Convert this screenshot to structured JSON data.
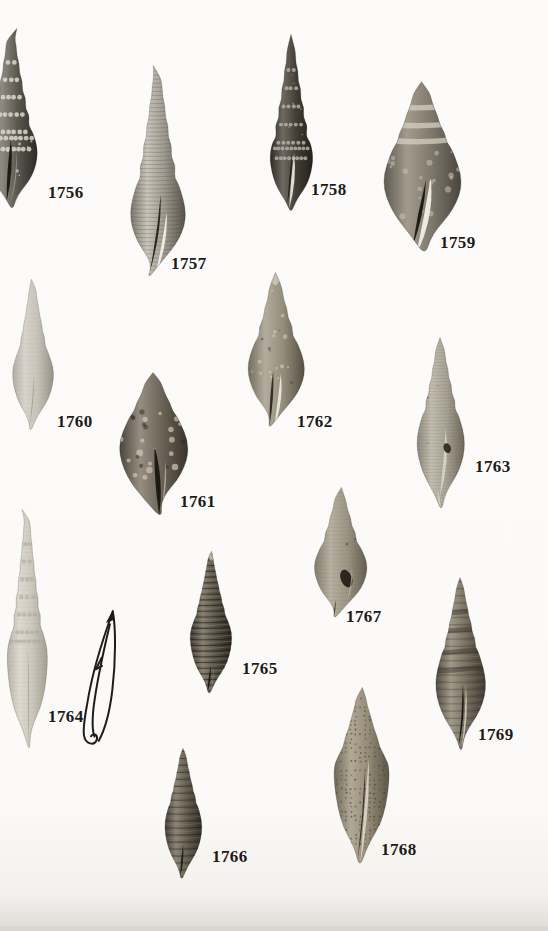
{
  "plate": {
    "kind": "photographic-plate-of-gastropod-shell-specimens",
    "figures": [
      {
        "id": "1756",
        "label": "1756",
        "kind": "specimen-photograph"
      },
      {
        "id": "1757",
        "label": "1757",
        "kind": "specimen-photograph"
      },
      {
        "id": "1758",
        "label": "1758",
        "kind": "specimen-photograph"
      },
      {
        "id": "1759",
        "label": "1759",
        "kind": "specimen-photograph"
      },
      {
        "id": "1760",
        "label": "1760",
        "kind": "specimen-photograph"
      },
      {
        "id": "1761",
        "label": "1761",
        "kind": "specimen-photograph"
      },
      {
        "id": "1762",
        "label": "1762",
        "kind": "specimen-photograph"
      },
      {
        "id": "1763",
        "label": "1763",
        "kind": "specimen-photograph"
      },
      {
        "id": "1764",
        "label": "1764",
        "kind": "specimen-photograph"
      },
      {
        "id": "1765",
        "label": "1765",
        "kind": "specimen-photograph"
      },
      {
        "id": "1766",
        "label": "1766",
        "kind": "specimen-photograph"
      },
      {
        "id": "1767",
        "label": "1767",
        "kind": "specimen-photograph"
      },
      {
        "id": "1768",
        "label": "1768",
        "kind": "specimen-photograph"
      },
      {
        "id": "1769",
        "label": "1769",
        "kind": "specimen-photograph"
      }
    ],
    "sketch": {
      "kind": "ink-outline-sketch-of-shell-profile"
    }
  },
  "colors": {
    "page_background": "#fbfaf8",
    "label_text": "#1d1b18",
    "page_bottom_edge": "#dcdbd6"
  }
}
